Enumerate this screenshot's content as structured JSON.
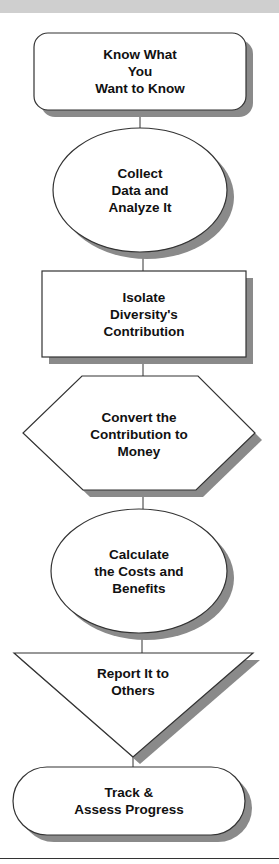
{
  "header": {
    "band_color": "#cfcfcf"
  },
  "colors": {
    "shape_fill": "#ffffff",
    "stroke": "#333333",
    "shadow": "#8a8a8a",
    "text": "#111111"
  },
  "steps": [
    {
      "shape": "rounded-rectangle",
      "label": "Know What\nYou\nWant to Know"
    },
    {
      "shape": "ellipse",
      "label": "Collect\nData and\nAnalyze It"
    },
    {
      "shape": "rectangle",
      "label": "Isolate\nDiversity's\nContribution"
    },
    {
      "shape": "hexagon",
      "label": "Convert the\nContribution to\nMoney"
    },
    {
      "shape": "ellipse",
      "label": "Calculate\nthe Costs and\nBenefits"
    },
    {
      "shape": "inverted-triangle",
      "label": "Report It to\nOthers"
    },
    {
      "shape": "pill",
      "label": "Track &\nAssess Progress"
    }
  ]
}
